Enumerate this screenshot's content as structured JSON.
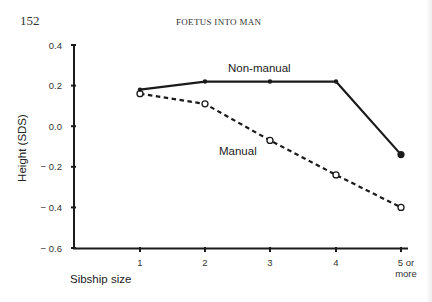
{
  "page": {
    "number": "152",
    "running_head": "FOETUS INTO MAN"
  },
  "chart_data": {
    "type": "line",
    "title": "",
    "xlabel": "Sibship size",
    "ylabel": "Height (SDS)",
    "categories": [
      "1",
      "2",
      "3",
      "4",
      "5 or more"
    ],
    "y_ticks": [
      "0.4",
      "0.2",
      "0.0",
      "− 0.2",
      "− 0.4",
      "− 0.6"
    ],
    "ylim": [
      -0.6,
      0.4
    ],
    "grid": false,
    "legend_position": "inline labels",
    "series": [
      {
        "name": "Non-manual",
        "style": "solid line, filled circles",
        "values": [
          0.18,
          0.22,
          0.22,
          0.22,
          -0.14
        ]
      },
      {
        "name": "Manual",
        "style": "dashed line, open circles",
        "values": [
          0.16,
          0.11,
          -0.07,
          -0.24,
          -0.4
        ]
      }
    ]
  }
}
